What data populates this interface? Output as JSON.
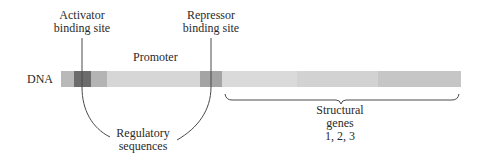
{
  "diagram": {
    "dna_label": "DNA",
    "labels": {
      "activator_line1": "Activator",
      "activator_line2": "binding site",
      "repressor_line1": "Repressor",
      "repressor_line2": "binding site",
      "promoter": "Promoter",
      "regulatory_line1": "Regulatory",
      "regulatory_line2": "sequences",
      "structural_line1": "Structural",
      "structural_line2": "genes",
      "structural_line3": "1, 2, 3"
    },
    "segments": [
      {
        "name": "left-flank",
        "x": 61,
        "w": 13,
        "color": "#b9b9b9"
      },
      {
        "name": "activator-site",
        "x": 74,
        "w": 17,
        "color": "#6c6c6c"
      },
      {
        "name": "activator-adjacent",
        "x": 91,
        "w": 16,
        "color": "#b4b4b4"
      },
      {
        "name": "promoter-region",
        "x": 107,
        "w": 93,
        "color": "#d6d6d6"
      },
      {
        "name": "repressor-site",
        "x": 200,
        "w": 22,
        "color": "#a4a4a4"
      },
      {
        "name": "gene-1",
        "x": 222,
        "w": 75,
        "color": "#dadada"
      },
      {
        "name": "gene-2",
        "x": 297,
        "w": 81,
        "color": "#d2d2d2"
      },
      {
        "name": "gene-3",
        "x": 378,
        "w": 83,
        "color": "#c6c6c6"
      }
    ],
    "line_color": "#4a4a4a"
  }
}
